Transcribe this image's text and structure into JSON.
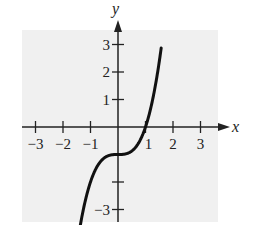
{
  "chart_data": {
    "type": "line",
    "title": "",
    "function": "y = x^3 - 1",
    "xlabel": "x",
    "ylabel": "y",
    "xlim": [
      -3.5,
      3.5
    ],
    "ylim": [
      -3.5,
      3.5
    ],
    "grid": false,
    "x_ticks": [
      -3,
      -2,
      -1,
      1,
      2,
      3
    ],
    "x_tick_labels": [
      "−3",
      "−2",
      "−1",
      "1",
      "2",
      "3"
    ],
    "y_ticks": [
      -3,
      -2,
      -1,
      1,
      2,
      3
    ],
    "y_tick_labels": [
      "−3",
      "",
      "",
      "1",
      "2",
      "3"
    ],
    "series": [
      {
        "name": "y = x^3 - 1",
        "x": [
          -1.4,
          -1.2,
          -1.0,
          -0.8,
          -0.6,
          -0.4,
          -0.2,
          0,
          0.2,
          0.4,
          0.6,
          0.8,
          1.0,
          1.2,
          1.4,
          1.6
        ],
        "y": [
          -3.74,
          -2.73,
          -2.0,
          -1.51,
          -1.22,
          -1.06,
          -1.01,
          -1.0,
          -0.99,
          -0.94,
          -0.78,
          -0.49,
          0.0,
          0.73,
          1.74,
          3.1
        ]
      }
    ],
    "colors": {
      "background_panel": "#f0f0f0",
      "curve": "#111111",
      "axis": "#222222"
    }
  }
}
